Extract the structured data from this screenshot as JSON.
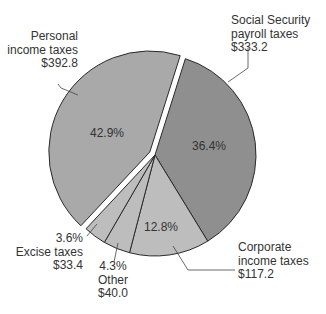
{
  "chart_data": {
    "type": "pie",
    "title": "",
    "unit": "billions of dollars",
    "exploded": "Personal income taxes",
    "slices": [
      {
        "label": "Personal income taxes",
        "label_lines": [
          "Personal",
          "income taxes"
        ],
        "value": 392.8,
        "value_text": "$392.8",
        "percent": 42.9,
        "percent_text": "42.9%",
        "color": "#a9a9a9"
      },
      {
        "label": "Social Security payroll taxes",
        "label_lines": [
          "Social Security",
          "payroll taxes"
        ],
        "value": 333.2,
        "value_text": "$333.2",
        "percent": 36.4,
        "percent_text": "36.4%",
        "color": "#8f8f8f"
      },
      {
        "label": "Corporate income taxes",
        "label_lines": [
          "Corporate",
          "income taxes"
        ],
        "value": 117.2,
        "value_text": "$117.2",
        "percent": 12.8,
        "percent_text": "12.8%",
        "color": "#bdbdbd"
      },
      {
        "label": "Other",
        "label_lines": [
          "Other"
        ],
        "value": 40.0,
        "value_text": "$40.0",
        "percent": 4.3,
        "percent_text": "4.3%",
        "color": "#bdbdbd"
      },
      {
        "label": "Excise taxes",
        "label_lines": [
          "Excise taxes"
        ],
        "value": 33.4,
        "value_text": "$33.4",
        "percent": 3.6,
        "percent_text": "3.6%",
        "color": "#bdbdbd"
      }
    ],
    "start_angle_deg": 17.5,
    "direction": "clockwise"
  }
}
